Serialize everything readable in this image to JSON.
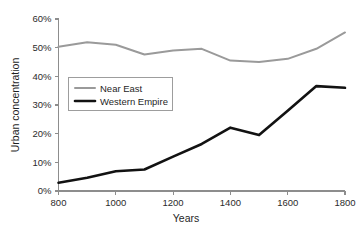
{
  "chart_data": {
    "type": "line",
    "title": "",
    "xlabel": "Years",
    "ylabel": "Urban concentration",
    "xlim": [
      800,
      1800
    ],
    "ylim": [
      0,
      60
    ],
    "grid": false,
    "legend_position": "inside-upper-left",
    "x": [
      800,
      900,
      1000,
      1100,
      1200,
      1300,
      1400,
      1500,
      1600,
      1700,
      1800
    ],
    "xticks": [
      "800",
      "1000",
      "1200",
      "1400",
      "1600",
      "1800"
    ],
    "xtick_values": [
      800,
      1000,
      1200,
      1400,
      1600,
      1800
    ],
    "yticks": [
      "0%",
      "10%",
      "20%",
      "30%",
      "40%",
      "50%",
      "60%"
    ],
    "ytick_values": [
      0,
      10,
      20,
      30,
      40,
      50,
      60
    ],
    "series": [
      {
        "name": "Near East",
        "color": "#9a9a9a",
        "width": 2,
        "values": [
          50.3,
          51.9,
          51.0,
          47.6,
          49.0,
          49.6,
          45.5,
          45.0,
          46.1,
          49.6,
          55.3
        ]
      },
      {
        "name": "Western Empire",
        "color": "#121212",
        "width": 2.6,
        "values": [
          2.9,
          4.6,
          6.9,
          7.5,
          12.0,
          16.4,
          22.1,
          19.5,
          28.0,
          36.6,
          36.0
        ]
      }
    ]
  },
  "legend": {
    "items": [
      {
        "label": "Near East"
      },
      {
        "label": "Western Empire"
      }
    ]
  },
  "axes": {
    "x_title": "Years",
    "y_title": "Urban concentration"
  }
}
